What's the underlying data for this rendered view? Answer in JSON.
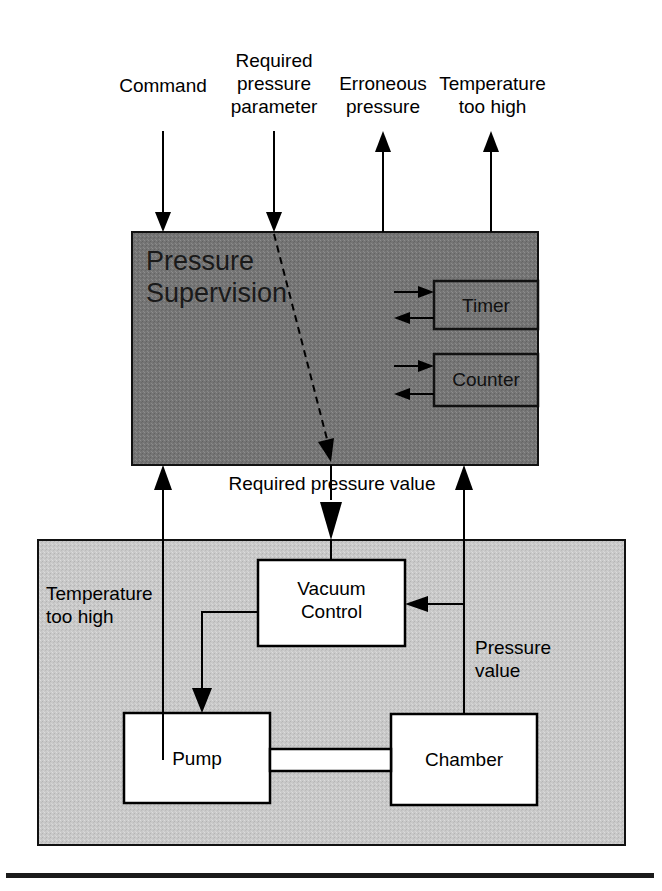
{
  "diagram": {
    "colors": {
      "background": "#ffffff",
      "supervision_block_fill": "#7a7a7a",
      "plant_block_fill": "#c8c8c8",
      "inner_box_fill": "#ffffff",
      "line": "#000000",
      "text": "#000000"
    },
    "external_signals": [
      {
        "id": "command",
        "label": "Command",
        "direction": "in"
      },
      {
        "id": "required-pressure-parameter",
        "label": "Required\npressure\nparameter",
        "direction": "in"
      },
      {
        "id": "erroneous-pressure",
        "label": "Erroneous\npressure",
        "direction": "out"
      },
      {
        "id": "temperature-too-high-out",
        "label": "Temperature\ntoo high",
        "direction": "out"
      }
    ],
    "supervision": {
      "title": "Pressure\nSupervision",
      "sub_blocks": [
        {
          "id": "timer",
          "label": "Timer"
        },
        {
          "id": "counter",
          "label": "Counter"
        }
      ]
    },
    "internal_signals": [
      {
        "id": "required-pressure-value",
        "label": "Required pressure value"
      },
      {
        "id": "temperature-too-high-in",
        "label": "Temperature\ntoo high"
      },
      {
        "id": "pressure-value",
        "label": "Pressure\nvalue"
      }
    ],
    "plant": {
      "boxes": [
        {
          "id": "vacuum-control",
          "label": "Vacuum\nControl"
        },
        {
          "id": "pump",
          "label": "Pump"
        },
        {
          "id": "chamber",
          "label": "Chamber"
        }
      ]
    }
  }
}
